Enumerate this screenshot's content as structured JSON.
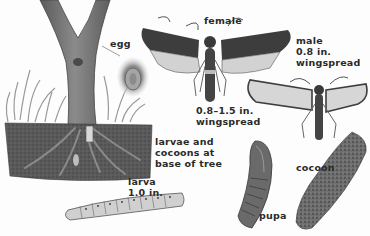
{
  "figure": {
    "palette": {
      "background": "#fdfdfd",
      "bark": "#7a7a7a",
      "bark_dark": "#4d4d4d",
      "soil": "#555555",
      "wing_dark": "#3d3d3d",
      "wing_light": "#d9d9d9",
      "cocoon": "#6b6b6b",
      "text": "#2a2a2a"
    }
  },
  "labels": {
    "egg": "egg",
    "female": "female",
    "female_span": "0.8–1.5 in.\nwingspread",
    "male": "male\n0.8 in.\nwingspread",
    "larvae_base": "larvae and\ncocoons at\nbase of tree",
    "larva": "larva\n1.0 in.",
    "pupa": "pupa",
    "cocoon": "cocoon"
  }
}
